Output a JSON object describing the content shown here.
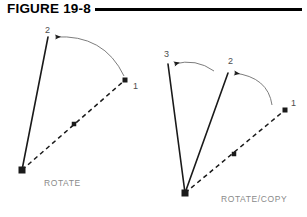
{
  "figure": {
    "title": "FIGURE 19-8",
    "rule_color": "#000000"
  },
  "colors": {
    "line": "#1a1a1a",
    "arc": "#7d7d7d",
    "marker": "#1a1a1a",
    "caption": "#8a8a8a",
    "label": "#4d4d4d",
    "background": "#ffffff"
  },
  "diagrams": [
    {
      "name": "rotate",
      "caption": "ROTATE",
      "pivot": {
        "x": 22,
        "y": 170
      },
      "original_line": {
        "style": "dashed",
        "from": {
          "x": 22,
          "y": 170
        },
        "to": {
          "x": 125,
          "y": 80
        },
        "endpoint_label": "1",
        "label_pos": {
          "x": 133,
          "y": 81
        },
        "midpoint_marker": {
          "x": 74,
          "y": 124
        }
      },
      "rotated_lines": [
        {
          "style": "solid",
          "from": {
            "x": 22,
            "y": 170
          },
          "to": {
            "x": 48,
            "y": 37
          },
          "endpoint_label": "2",
          "label_pos": {
            "x": 45,
            "y": 25
          },
          "arc": {
            "from": {
              "x": 124,
              "y": 76
            },
            "to": {
              "x": 55,
              "y": 37
            },
            "control": {
              "x": 104,
              "y": 34
            }
          }
        }
      ]
    },
    {
      "name": "rotate-copy",
      "caption": "ROTATE/COPY",
      "pivot": {
        "x": 185,
        "y": 193
      },
      "original_line": {
        "style": "dashed",
        "from": {
          "x": 185,
          "y": 193
        },
        "to": {
          "x": 285,
          "y": 110
        },
        "endpoint_label": "1",
        "label_pos": {
          "x": 291,
          "y": 98
        },
        "midpoint_marker": {
          "x": 234,
          "y": 154
        }
      },
      "rotated_lines": [
        {
          "style": "solid",
          "from": {
            "x": 185,
            "y": 193
          },
          "to": {
            "x": 228,
            "y": 73
          },
          "endpoint_label": "2",
          "label_pos": {
            "x": 228,
            "y": 56
          },
          "arc": {
            "from": {
              "x": 272,
              "y": 105
            },
            "to": {
              "x": 234,
              "y": 73
            },
            "control": {
              "x": 268,
              "y": 77
            }
          }
        },
        {
          "style": "solid",
          "from": {
            "x": 185,
            "y": 193
          },
          "to": {
            "x": 168,
            "y": 64
          },
          "endpoint_label": "3",
          "label_pos": {
            "x": 164,
            "y": 49
          },
          "arc": {
            "from": {
              "x": 214,
              "y": 71
            },
            "to": {
              "x": 174,
              "y": 64
            },
            "control": {
              "x": 196,
              "y": 58
            }
          }
        }
      ]
    }
  ]
}
